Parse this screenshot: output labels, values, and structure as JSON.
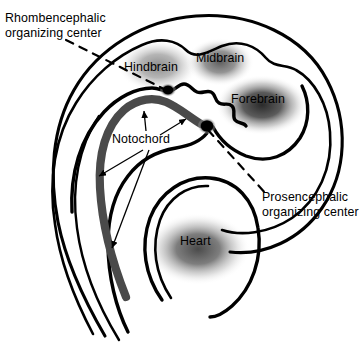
{
  "figure": {
    "width": 363,
    "height": 345,
    "background": "#ffffff"
  },
  "callouts": [
    {
      "id": "rhombencephalic",
      "line1": "Rhombencephalic",
      "line2": "organizing center",
      "leader": "dashed"
    },
    {
      "id": "prosencephalic",
      "line1": "Prosencephalic",
      "line2": "organizing center",
      "leader": "dashed"
    }
  ],
  "structures": [
    {
      "id": "hindbrain",
      "label": "Hindbrain",
      "shading": "#8f8f8f"
    },
    {
      "id": "midbrain",
      "label": "Midbrain",
      "shading": "#6b6b6b"
    },
    {
      "id": "forebrain",
      "label": "Forebrain",
      "shading": "#3a3a3a"
    },
    {
      "id": "notochord",
      "label": "Notochord",
      "shading": "#4a4a4a"
    },
    {
      "id": "heart",
      "label": "Heart",
      "shading": "#555555"
    }
  ],
  "colors": {
    "outline": "#000000",
    "notochord": "#4a4a4a",
    "node": "#000000",
    "text": "#000000",
    "paper": "#ffffff"
  },
  "legend_note": ""
}
